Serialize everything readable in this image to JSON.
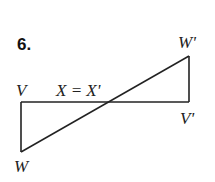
{
  "problem_number": "6.",
  "labels": {
    "V": "V",
    "X": "X = X'",
    "W_prime": "W'",
    "V_prime": "V'",
    "W": "W"
  },
  "colors": {
    "line": "#222222",
    "background": "#ffffff"
  },
  "figure": {
    "points": {
      "V": [
        21,
        102
      ],
      "W": [
        21,
        152
      ],
      "X": [
        105,
        102
      ],
      "V_prime": [
        189,
        102
      ],
      "W_prime": [
        189,
        56
      ]
    }
  }
}
